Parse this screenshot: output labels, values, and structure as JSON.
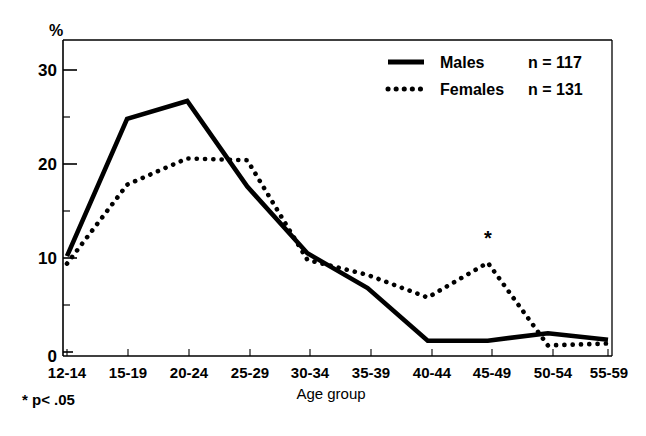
{
  "chart_data": {
    "type": "line",
    "title": "",
    "subtitle": "",
    "xlabel": "Age group",
    "ylabel": "%",
    "categories": [
      "12-14",
      "15-19",
      "20-24",
      "25-29",
      "30-34",
      "35-39",
      "40-44",
      "45-49",
      "50-54",
      "55-59"
    ],
    "series": [
      {
        "name": "Males",
        "n_label": "n = 117",
        "style": "solid",
        "color": "#000000",
        "values": [
          10.2,
          24.8,
          26.7,
          17.6,
          10.5,
          6.8,
          1.2,
          1.2,
          2.0,
          1.3
        ]
      },
      {
        "name": "Females",
        "n_label": "n = 131",
        "style": "dotted",
        "color": "#000000",
        "values": [
          9.4,
          17.8,
          20.6,
          20.4,
          9.8,
          8.2,
          5.8,
          9.5,
          0.7,
          0.9
        ]
      }
    ],
    "yticks": [
      0,
      10,
      20,
      30
    ],
    "yticks_minor": [
      5,
      15,
      25
    ],
    "ylim": [
      0,
      32.5
    ],
    "grid": false,
    "legend_position": "top-right",
    "annotations": [
      {
        "text": "*",
        "category": "45-49",
        "value": 12.0,
        "note": "significance marker above female 45-49 peak"
      }
    ],
    "footnote": "* p< .05"
  },
  "axes": {
    "y_axis_unit_label": "%",
    "y_tick_labels": [
      "0",
      "10",
      "20",
      "30"
    ],
    "x_tick_labels": [
      "12-14",
      "15-19",
      "20-24",
      "25-29",
      "30-34",
      "35-39",
      "40-44",
      "45-49",
      "50-54",
      "55-59"
    ],
    "x_axis_title": "Age group"
  },
  "legend": {
    "entries": [
      {
        "label": "Males",
        "n": "n = 117",
        "marker": "solid-line-swatch"
      },
      {
        "label": "Females",
        "n": "n = 131",
        "marker": "dotted-line-swatch"
      }
    ]
  },
  "notes": {
    "footnote": "* p< .05",
    "asterisk": "*"
  }
}
